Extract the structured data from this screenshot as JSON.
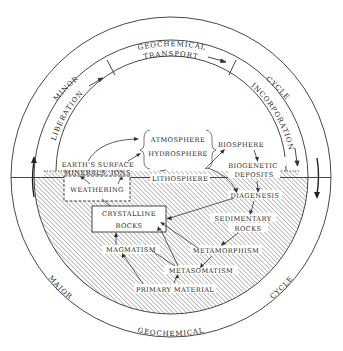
{
  "diagram": {
    "type": "geochemical-cycle",
    "outer_ring": {
      "top_labels": [
        "MINOR",
        "GEOCHEMICAL",
        "CYCLE"
      ],
      "bottom_labels": [
        "MAJOR",
        "GEOCHEMICAL",
        "CYCLE"
      ]
    },
    "minor_cycle_band": {
      "liberation": "LIBERATION",
      "transport": "TRANSPORT",
      "incorporation": "INCORPORATION"
    },
    "nodes": {
      "atmosphere": "ATMOSPHERE",
      "hydrosphere": "HYDROSPHERE",
      "biosphere": "BIOSPHERE",
      "earths_surface": "EARTH'S SURFACE",
      "minerals": "MINERALS",
      "ions": "IONS",
      "lithosphere": "LITHOSPHERE",
      "weathering": "WEATHERING",
      "biogenetic": "BIOGENETIC",
      "deposits": "DEPOSITS",
      "diagenesis": "DIAGENESIS",
      "crystalline": "CRYSTALLINE",
      "rocks": "ROCKS",
      "sedimentary": "SEDIMENTARY",
      "sedimentary_rocks": "ROCKS",
      "metamorphism": "METAMORPHISM",
      "magmatism": "MAGMATISM",
      "metasomatism": "METASOMATISM",
      "primary_material": "PRIMARY MATERIAL"
    },
    "colors": {
      "line": "#333333",
      "hatch": "#555555",
      "background": "#ffffff"
    }
  }
}
